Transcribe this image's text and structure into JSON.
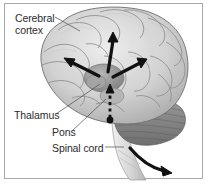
{
  "figure": {
    "kind": "anatomical-diagram",
    "border_color": "#a8a8a8",
    "background_color": "#ffffff",
    "text_color": "#2b2b2b"
  },
  "labels": {
    "cerebral_cortex": "Cerebral\ncortex",
    "cerebral_cortex_line1": "Cerebral",
    "cerebral_cortex_line2": "cortex",
    "thalamus": "Thalamus",
    "pons": "Pons",
    "spinal_cord": "Spinal cord"
  },
  "structures": [
    {
      "name": "cerebral-cortex",
      "tone": "#d9d9d9"
    },
    {
      "name": "cerebellum",
      "tone": "#8f8f8f"
    },
    {
      "name": "thalamus",
      "tone": "#9a9a9a"
    },
    {
      "name": "pons",
      "tone": "#b0b0b0"
    },
    {
      "name": "brainstem-spinal-cord",
      "tone": "#e2e2e2"
    }
  ],
  "arrows": {
    "solid_color": "#111111",
    "projection_up_left": "thalamus-to-frontal-cortex",
    "projection_up_center": "thalamus-to-superior-cortex",
    "projection_up_right": "thalamus-to-parietal-cortex",
    "ascending_dashed": "pons-to-thalamus",
    "descending_curved": "spinal-cord-outflow"
  }
}
